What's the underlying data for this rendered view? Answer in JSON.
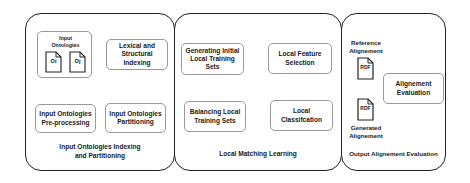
{
  "phases": [
    {
      "id": "indexing",
      "caption": "Input Ontologies Indexing and Partitioning",
      "caption_lines": [
        "Input Ontologies Indexing",
        "and Partitioning"
      ],
      "nodes": {
        "input_ontologies": {
          "title_lines": [
            "Input",
            "Ontologies"
          ],
          "docs": [
            "Oi",
            "Oj"
          ]
        },
        "preprocessing": {
          "lines": [
            "Input Ontologies",
            "Pre-processing"
          ]
        },
        "indexing": {
          "lines": [
            "Lexical and",
            "Structural Indexing"
          ]
        },
        "partitioning": {
          "lines": [
            "Input Ontologies",
            "Partitioning"
          ]
        }
      }
    },
    {
      "id": "matching",
      "caption": "Local Matching Learning",
      "nodes": {
        "generating": {
          "lines": [
            "Generating Initial",
            "Local Training Sets"
          ]
        },
        "balancing": {
          "lines": [
            "Balancing Local",
            "Training Sets"
          ]
        },
        "feature_selection": {
          "lines": [
            "Local Feature",
            "Selection"
          ]
        },
        "classification": {
          "lines": [
            "Local Classifcation"
          ]
        }
      }
    },
    {
      "id": "evaluation",
      "caption": "Output Alignement Evaluation",
      "nodes": {
        "reference": {
          "label_lines": [
            "Reference",
            "Alignement"
          ],
          "doc": "RDF"
        },
        "generated": {
          "label_lines": [
            "Generated",
            "Alignement"
          ],
          "doc": "RDF"
        },
        "evaluation": {
          "lines": [
            "Alignement",
            "Evaluation"
          ]
        }
      }
    }
  ],
  "colors": {
    "phase_border": "#222222",
    "node_border": "#9a9a9a",
    "arrow": "#333333",
    "text": "#1a1a1a"
  }
}
